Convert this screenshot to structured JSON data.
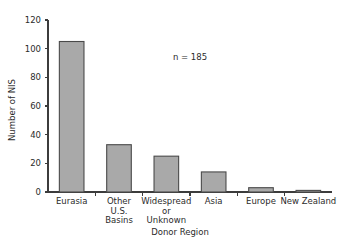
{
  "chart_data": {
    "type": "bar",
    "title": "",
    "subtitle": "",
    "xlabel": "Donor Region",
    "ylabel": "Number of NIS",
    "categories": [
      "Eurasia",
      "Other U.S. Basins",
      "Widespread or Unknown",
      "Asia",
      "Europe",
      "New Zealand"
    ],
    "category_lines": [
      [
        "Eurasia"
      ],
      [
        "Other",
        "U.S.",
        "Basins"
      ],
      [
        "Widespread",
        "or",
        "Unknown"
      ],
      [
        "Asia"
      ],
      [
        "Europe"
      ],
      [
        "New Zealand"
      ]
    ],
    "values": [
      105,
      33,
      25,
      14,
      3,
      1
    ],
    "ylim": [
      0,
      120
    ],
    "yticks": [
      0,
      20,
      40,
      60,
      80,
      100,
      120
    ],
    "ytick_labels": [
      "0",
      "20",
      "40",
      "60",
      "80",
      "100",
      "120"
    ],
    "grid": false,
    "legend": "none",
    "annotations": [
      {
        "text": "n = 185",
        "x_value": 3.0,
        "y_value": 92
      }
    ],
    "colors": {
      "bar_fill": "#a9a9a9",
      "bar_edge": "#4a4a4a",
      "axis": "#3c3c3c",
      "text": "#2b2b2b",
      "background": "#ffffff"
    }
  }
}
